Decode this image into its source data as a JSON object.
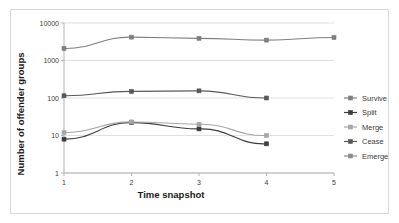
{
  "chart_data": {
    "type": "line",
    "title": "",
    "xlabel": "Time snapshot",
    "ylabel": "Number of offender groups",
    "x": [
      1,
      2,
      3,
      4,
      5
    ],
    "xticklabels": [
      "1",
      "2",
      "3",
      "4",
      "5"
    ],
    "yscale": "log",
    "ylim": [
      1,
      10000
    ],
    "yticks": [
      1,
      10,
      100,
      1000,
      10000
    ],
    "yticklabels": [
      "1",
      "10",
      "100",
      "1000",
      "10000"
    ],
    "grid": "horizontal",
    "legend_position": "right",
    "series": [
      {
        "name": "Survive",
        "color": "#7f7f7f",
        "marker": "square",
        "x": [
          1,
          2,
          3,
          4,
          5
        ],
        "values": [
          2100,
          4200,
          3900,
          3500,
          4100
        ]
      },
      {
        "name": "Split",
        "color": "#3d3d3d",
        "marker": "square",
        "x": [
          1,
          2,
          3,
          4
        ],
        "values": [
          8,
          22,
          15,
          6
        ]
      },
      {
        "name": "Merge",
        "color": "#a6a6a6",
        "marker": "square",
        "x": [
          1,
          2,
          3,
          4
        ],
        "values": [
          12,
          23,
          20,
          10
        ]
      },
      {
        "name": "Cease",
        "color": "#595959",
        "marker": "square",
        "x": [
          1,
          2,
          3,
          4
        ],
        "values": [
          115,
          150,
          155,
          100
        ]
      },
      {
        "name": "Emerge",
        "color": "#8c8c8c",
        "marker": "square",
        "x": [],
        "values": []
      }
    ]
  }
}
